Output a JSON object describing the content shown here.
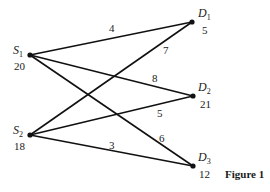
{
  "figure_label": "Figure 1",
  "colors": {
    "line": "#111111",
    "text": "#1a1a1a",
    "background": "#ffffff"
  },
  "sources": [
    {
      "id": "S1",
      "letter": "S",
      "sub": "1",
      "supply": "20"
    },
    {
      "id": "S2",
      "letter": "S",
      "sub": "2",
      "supply": "18"
    }
  ],
  "destinations": [
    {
      "id": "D1",
      "letter": "D",
      "sub": "1",
      "demand": "5"
    },
    {
      "id": "D2",
      "letter": "D",
      "sub": "2",
      "demand": "21"
    },
    {
      "id": "D3",
      "letter": "D",
      "sub": "3",
      "demand": "12"
    }
  ],
  "edges": [
    {
      "from": "S1",
      "to": "D1",
      "cost": "4"
    },
    {
      "from": "S1",
      "to": "D2",
      "cost": "8"
    },
    {
      "from": "S1",
      "to": "D3",
      "cost": "6"
    },
    {
      "from": "S2",
      "to": "D1",
      "cost": "7"
    },
    {
      "from": "S2",
      "to": "D2",
      "cost": "5"
    },
    {
      "from": "S2",
      "to": "D3",
      "cost": "3"
    }
  ]
}
